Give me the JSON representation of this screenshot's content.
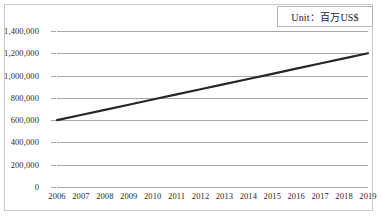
{
  "legend": {
    "unit_label": "Unit：百万US$"
  },
  "chart_data": {
    "type": "line",
    "title": "",
    "subtitle": "",
    "xlabel": "",
    "ylabel": "",
    "unit_note": "Unit：百万US$",
    "categories": [
      "2006",
      "2007",
      "2008",
      "2009",
      "2010",
      "2011",
      "2012",
      "2013",
      "2014",
      "2015",
      "2016",
      "2017",
      "2018",
      "2019"
    ],
    "x": [
      2006,
      2007,
      2008,
      2009,
      2010,
      2011,
      2012,
      2013,
      2014,
      2015,
      2016,
      2017,
      2018,
      2019
    ],
    "values": [
      600000,
      646000,
      692000,
      738000,
      785000,
      831000,
      877000,
      923000,
      969000,
      1015000,
      1062000,
      1108000,
      1154000,
      1200000
    ],
    "series": [
      {
        "name": "value",
        "values": [
          600000,
          646000,
          692000,
          738000,
          785000,
          831000,
          877000,
          923000,
          969000,
          1015000,
          1062000,
          1108000,
          1154000,
          1200000
        ],
        "color": "#262626"
      }
    ],
    "ylim": [
      0,
      1400000
    ],
    "yticks": [
      0,
      200000,
      400000,
      600000,
      800000,
      1000000,
      1200000,
      1400000
    ],
    "ytick_labels": [
      "0",
      "200,000",
      "400,000",
      "600,000",
      "800,000",
      "1,000,000",
      "1,200,000",
      "1,400,000"
    ],
    "xlim": [
      2006,
      2019
    ],
    "grid": "horizontal",
    "legend_position": "top-right",
    "line_color": "#262626",
    "grid_color": "#a9a9a9",
    "background": "#ffffff",
    "markers": false
  }
}
